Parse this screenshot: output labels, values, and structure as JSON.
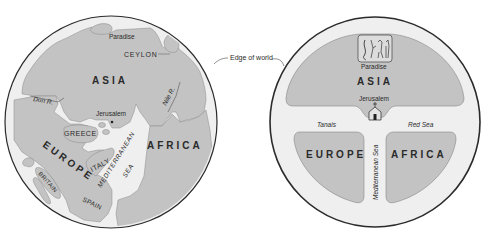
{
  "colors": {
    "land": "#c3c3c3",
    "sea": "#efefef",
    "rim": "#2b2b2b",
    "background": "#ffffff",
    "text": "#2a2a2a"
  },
  "annotation": {
    "edge_label": "Edge of world"
  },
  "geographic_map": {
    "title": "",
    "labels": {
      "paradise": "Paradise",
      "ceylon": "CEYLON",
      "asia": "ASIA",
      "don": "Don R.",
      "nile": "Nile R.",
      "jerusalem": "Jerusalem",
      "greece": "GREECE",
      "europe": "EUROPE",
      "africa": "AFRICA",
      "italy": "ITALY",
      "mediterranean": "MEDITERRANEAN",
      "sea": "SEA",
      "britain": "BRITAIN",
      "spain": "SPAIN"
    }
  },
  "t_o_map": {
    "labels": {
      "paradise": "Paradise",
      "asia": "ASIA",
      "jerusalem": "Jerusalem",
      "tanais": "Tanais",
      "red_sea": "Red Sea",
      "europe": "EUROPE",
      "africa": "AFRICA",
      "mediterranean_sea": "Mediterranean Sea"
    },
    "icons": [
      "paradise-vignette-icon",
      "church-icon"
    ]
  }
}
